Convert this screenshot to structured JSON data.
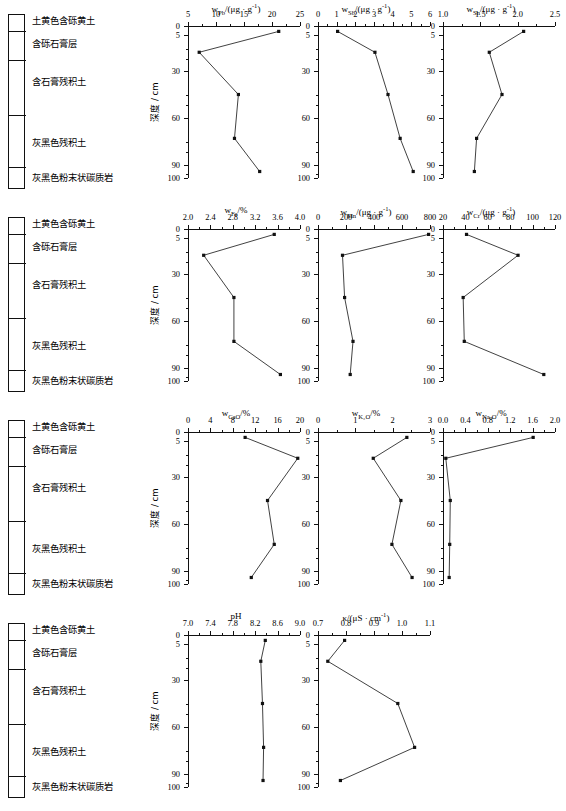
{
  "figure": {
    "depth_axis_label": "深度 / cm",
    "depth_ticks": [
      0,
      5,
      30,
      60,
      90,
      100
    ],
    "depths": [
      3,
      17,
      45,
      73,
      95
    ]
  },
  "stratigraphy": {
    "boundaries_pct": [
      9,
      26,
      58,
      88
    ],
    "layers": [
      {
        "label": "土黄色含砾黄土",
        "top_pct": 1
      },
      {
        "label": "含砾石膏层",
        "top_pct": 14
      },
      {
        "label": "含石膏残积土",
        "top_pct": 36
      },
      {
        "label": "灰黑色残积土",
        "top_pct": 71
      },
      {
        "label": "灰黑色粉末状碳质岩",
        "top_pct": 91
      }
    ]
  },
  "chart_data": [
    {
      "id": "pb",
      "type": "line",
      "title": "w<sub>Pb</sub>/(μg · g<sup>-1</sup>)",
      "xlabel": "w_Pb/(μg·g⁻¹)",
      "ylabel": "深度 / cm",
      "xlim": [
        5,
        25
      ],
      "xticks": [
        5,
        10,
        15,
        20,
        25
      ],
      "minor_per_major": 2,
      "ylim": [
        0,
        100
      ],
      "grid": false,
      "x": [
        21.2,
        7.0,
        14.0,
        13.3,
        17.8
      ],
      "y": [
        3,
        17,
        45,
        73,
        95
      ]
    },
    {
      "id": "sb",
      "type": "line",
      "title": "w<sub>Sb</sub>/(μg · g<sup>-1</sup>)",
      "xlabel": "w_Sb/(μg·g⁻¹)",
      "ylabel": "深度 / cm",
      "xlim": [
        0,
        6
      ],
      "xticks": [
        0,
        1,
        2,
        3,
        4,
        5,
        6
      ],
      "minor_per_major": 2,
      "ylim": [
        0,
        100
      ],
      "grid": false,
      "x": [
        1.05,
        3.05,
        3.75,
        4.4,
        5.1
      ],
      "y": [
        3,
        17,
        45,
        73,
        95
      ]
    },
    {
      "id": "sn",
      "type": "line",
      "title": "w<sub>Sn</sub>/(μg · g<sup>-1</sup>)",
      "xlabel": "w_Sn/(μg·g⁻¹)",
      "ylabel": "深度 / cm",
      "xlim": [
        1.0,
        2.5
      ],
      "xticks": [
        1.0,
        1.5,
        2.0,
        2.5
      ],
      "minor_per_major": 2,
      "ylim": [
        0,
        100
      ],
      "grid": false,
      "x": [
        2.08,
        1.62,
        1.79,
        1.45,
        1.42
      ],
      "y": [
        3,
        17,
        45,
        73,
        95
      ]
    },
    {
      "id": "fe",
      "type": "line",
      "title": "w<sub>Fe</sub>/%",
      "xlabel": "w_Fe/%",
      "ylabel": "深度 / cm",
      "xlim": [
        2.0,
        4.0
      ],
      "xticks": [
        2.0,
        2.4,
        2.8,
        3.2,
        3.6,
        4.0
      ],
      "minor_per_major": 2,
      "ylim": [
        0,
        100
      ],
      "grid": false,
      "x": [
        3.54,
        2.28,
        2.82,
        2.82,
        3.65
      ],
      "y": [
        3,
        17,
        45,
        73,
        95
      ]
    },
    {
      "id": "mn",
      "type": "line",
      "title": "w<sub>Mn</sub>/(μg · g<sup>-1</sup>)",
      "xlabel": "w_Mn/(μg·g⁻¹)",
      "ylabel": "深度 / cm",
      "xlim": [
        0,
        800
      ],
      "xticks": [
        0,
        200,
        400,
        600,
        800
      ],
      "minor_per_major": 2,
      "ylim": [
        0,
        100
      ],
      "grid": false,
      "x": [
        790,
        175,
        190,
        250,
        230
      ],
      "y": [
        3,
        17,
        45,
        73,
        95
      ]
    },
    {
      "id": "cr",
      "type": "line",
      "title": "w<sub>Cr</sub>/(μg · g<sup>-1</sup>)",
      "xlabel": "w_Cr/(μg·g⁻¹)",
      "ylabel": "深度 / cm",
      "xlim": [
        20,
        120
      ],
      "xticks": [
        20,
        40,
        60,
        80,
        100,
        120
      ],
      "minor_per_major": 2,
      "ylim": [
        0,
        100
      ],
      "grid": false,
      "x": [
        41,
        87,
        38,
        39,
        110
      ],
      "y": [
        3,
        17,
        45,
        73,
        95
      ]
    },
    {
      "id": "cao",
      "type": "line",
      "title": "w<sub>CaO</sub>/%",
      "xlabel": "w_CaO/%",
      "ylabel": "深度 / cm",
      "xlim": [
        0,
        20
      ],
      "xticks": [
        0,
        4,
        8,
        12,
        16,
        20
      ],
      "minor_per_major": 2,
      "ylim": [
        0,
        100
      ],
      "grid": false,
      "x": [
        10.2,
        19.6,
        14.2,
        15.4,
        11.3
      ],
      "y": [
        3,
        17,
        45,
        73,
        95
      ]
    },
    {
      "id": "k2o",
      "type": "line",
      "title": "w<sub>K₂O</sub>/%",
      "xlabel": "w_K2O/%",
      "ylabel": "深度 / cm",
      "xlim": [
        0,
        3
      ],
      "xticks": [
        0,
        1,
        2,
        3
      ],
      "minor_per_major": 2,
      "ylim": [
        0,
        100
      ],
      "grid": false,
      "x": [
        2.38,
        1.48,
        2.22,
        1.98,
        2.52
      ],
      "y": [
        3,
        17,
        45,
        73,
        95
      ]
    },
    {
      "id": "na2o",
      "type": "line",
      "title": "w<sub>Na₂O</sub>/%",
      "xlabel": "w_Na2O/%",
      "ylabel": "深度 / cm",
      "xlim": [
        0,
        2.0
      ],
      "xticks": [
        0,
        0.4,
        0.8,
        1.2,
        1.6,
        2.0
      ],
      "minor_per_major": 2,
      "ylim": [
        0,
        100
      ],
      "grid": false,
      "x": [
        1.61,
        0.05,
        0.13,
        0.12,
        0.11
      ],
      "y": [
        3,
        17,
        45,
        73,
        95
      ]
    },
    {
      "id": "ph",
      "type": "line",
      "title": "pH",
      "xlabel": "pH",
      "ylabel": "深度 / cm",
      "xlim": [
        7.0,
        9.0
      ],
      "xticks": [
        7.0,
        7.4,
        7.8,
        8.2,
        8.6,
        9.0
      ],
      "minor_per_major": 2,
      "ylim": [
        0,
        100
      ],
      "grid": false,
      "x": [
        8.38,
        8.3,
        8.33,
        8.35,
        8.34
      ],
      "y": [
        3,
        17,
        45,
        73,
        95
      ]
    },
    {
      "id": "kappa",
      "type": "line",
      "title": "κ/(μS · cm<sup>-1</sup>)",
      "xlabel": "κ/(μS·cm⁻¹)",
      "ylabel": "深度 / cm",
      "xlim": [
        0.7,
        1.1
      ],
      "xticks": [
        0.7,
        0.8,
        0.9,
        1.0,
        1.1
      ],
      "minor_per_major": 2,
      "ylim": [
        0,
        100
      ],
      "grid": false,
      "x": [
        0.795,
        0.735,
        0.985,
        1.045,
        0.78
      ],
      "y": [
        3,
        17,
        45,
        73,
        95
      ]
    }
  ],
  "rows": [
    {
      "panels": [
        "pb",
        "sb",
        "sn"
      ]
    },
    {
      "panels": [
        "fe",
        "mn",
        "cr"
      ]
    },
    {
      "panels": [
        "cao",
        "k2o",
        "na2o"
      ]
    },
    {
      "panels": [
        "ph",
        "kappa"
      ]
    }
  ]
}
